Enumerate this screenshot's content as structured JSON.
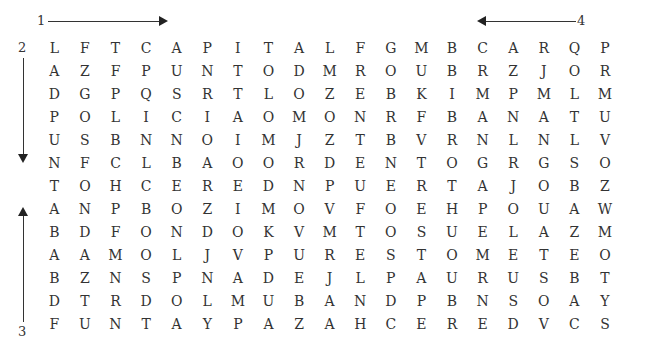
{
  "direction_labels": {
    "label_1": "1",
    "label_2": "2",
    "label_3": "3",
    "label_4": "4"
  },
  "grid": {
    "rows": [
      [
        "L",
        "F",
        "T",
        "C",
        "A",
        "P",
        "I",
        "T",
        "A",
        "L",
        "F",
        "G",
        "M",
        "B",
        "C",
        "A",
        "R",
        "Q",
        "P"
      ],
      [
        "A",
        "Z",
        "F",
        "P",
        "U",
        "N",
        "T",
        "O",
        "D",
        "M",
        "R",
        "O",
        "U",
        "B",
        "R",
        "Z",
        "J",
        "O",
        "R"
      ],
      [
        "D",
        "G",
        "P",
        "Q",
        "S",
        "R",
        "T",
        "L",
        "O",
        "Z",
        "E",
        "B",
        "K",
        "I",
        "M",
        "P",
        "M",
        "L",
        "M"
      ],
      [
        "P",
        "O",
        "L",
        "I",
        "C",
        "I",
        "A",
        "O",
        "M",
        "O",
        "N",
        "R",
        "F",
        "B",
        "A",
        "N",
        "A",
        "T",
        "U"
      ],
      [
        "U",
        "S",
        "B",
        "N",
        "N",
        "O",
        "I",
        "M",
        "J",
        "Z",
        "T",
        "B",
        "V",
        "R",
        "N",
        "L",
        "N",
        "L",
        "V"
      ],
      [
        "N",
        "F",
        "C",
        "L",
        "B",
        "A",
        "O",
        "O",
        "R",
        "D",
        "E",
        "N",
        "T",
        "O",
        "G",
        "R",
        "G",
        "S",
        "O"
      ],
      [
        "T",
        "O",
        "H",
        "C",
        "E",
        "R",
        "E",
        "D",
        "N",
        "P",
        "U",
        "E",
        "R",
        "T",
        "A",
        "J",
        "O",
        "B",
        "Z"
      ],
      [
        "A",
        "N",
        "P",
        "B",
        "O",
        "Z",
        "I",
        "M",
        "O",
        "V",
        "F",
        "O",
        "E",
        "H",
        "P",
        "O",
        "U",
        "A",
        "W"
      ],
      [
        "B",
        "D",
        "F",
        "O",
        "N",
        "D",
        "O",
        "K",
        "V",
        "M",
        "T",
        "O",
        "S",
        "U",
        "E",
        "L",
        "A",
        "Z",
        "M"
      ],
      [
        "A",
        "A",
        "M",
        "O",
        "L",
        "J",
        "V",
        "P",
        "U",
        "R",
        "E",
        "S",
        "T",
        "O",
        "M",
        "E",
        "T",
        "E",
        "O"
      ],
      [
        "B",
        "Z",
        "N",
        "S",
        "P",
        "N",
        "A",
        "D",
        "E",
        "J",
        "L",
        "P",
        "A",
        "U",
        "R",
        "U",
        "S",
        "B",
        "T"
      ],
      [
        "D",
        "T",
        "R",
        "D",
        "O",
        "L",
        "M",
        "U",
        "B",
        "A",
        "N",
        "D",
        "P",
        "B",
        "N",
        "S",
        "O",
        "A",
        "Y"
      ],
      [
        "F",
        "U",
        "N",
        "T",
        "A",
        "Y",
        "P",
        "A",
        "Z",
        "A",
        "H",
        "C",
        "E",
        "R",
        "E",
        "D",
        "V",
        "C",
        "S"
      ]
    ]
  }
}
